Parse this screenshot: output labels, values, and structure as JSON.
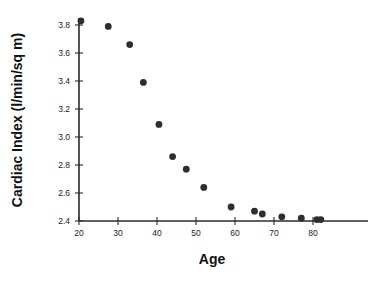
{
  "chart_data": {
    "type": "scatter",
    "title": "",
    "xlabel": "Age",
    "ylabel": "Cardiac Index (l/min/sq m)",
    "xlim": [
      18,
      86
    ],
    "ylim": [
      2.4,
      3.88
    ],
    "grid": false,
    "legend": null,
    "xticks": [
      20,
      30,
      40,
      50,
      60,
      70,
      80
    ],
    "xtick_labels": [
      "20",
      "30",
      "40",
      "50",
      "60",
      "70",
      "80"
    ],
    "yticks": [
      2.4,
      2.6,
      2.8,
      3.0,
      3.2,
      3.4,
      3.6,
      3.8
    ],
    "ytick_labels": [
      "2.4",
      "2.6",
      "2.8",
      "3.0",
      "3.2",
      "3.4",
      "3.6",
      "3.8"
    ],
    "marker": "filled-circle",
    "marker_color": "#2e2e2e",
    "marker_size": 3.4,
    "x": [
      20.5,
      27.5,
      33.0,
      36.5,
      40.5,
      44.0,
      47.5,
      52.0,
      59.0,
      65.0,
      67.0,
      72.0,
      77.0,
      81.0,
      82.0
    ],
    "y": [
      3.83,
      3.79,
      3.66,
      3.39,
      3.09,
      2.86,
      2.77,
      2.64,
      2.5,
      2.47,
      2.45,
      2.43,
      2.42,
      2.41,
      2.41
    ],
    "points": [
      {
        "age": 20.5,
        "cardiac_index": 3.83
      },
      {
        "age": 27.5,
        "cardiac_index": 3.79
      },
      {
        "age": 33.0,
        "cardiac_index": 3.66
      },
      {
        "age": 36.5,
        "cardiac_index": 3.39
      },
      {
        "age": 40.5,
        "cardiac_index": 3.09
      },
      {
        "age": 44.0,
        "cardiac_index": 2.86
      },
      {
        "age": 47.5,
        "cardiac_index": 2.77
      },
      {
        "age": 52.0,
        "cardiac_index": 2.64
      },
      {
        "age": 59.0,
        "cardiac_index": 2.5
      },
      {
        "age": 65.0,
        "cardiac_index": 2.47
      },
      {
        "age": 67.0,
        "cardiac_index": 2.45
      },
      {
        "age": 72.0,
        "cardiac_index": 2.43
      },
      {
        "age": 77.0,
        "cardiac_index": 2.42
      },
      {
        "age": 81.0,
        "cardiac_index": 2.41
      },
      {
        "age": 82.0,
        "cardiac_index": 2.41
      }
    ]
  },
  "colors": {
    "background": "#ffffff",
    "axis": "#2b2b2b",
    "marker": "#2e2e2e",
    "text": "#111111"
  }
}
